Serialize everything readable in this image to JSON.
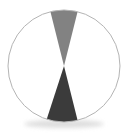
{
  "figure": {
    "background_color": "#ffffff",
    "width": 136,
    "height": 135
  },
  "chart_data": {
    "type": "pie",
    "title": "",
    "subtitle": "",
    "xlabel": "",
    "ylabel": "",
    "legend_position": "none",
    "grid": false,
    "labels_visible": false,
    "center": {
      "x": 64,
      "y": 66
    },
    "radius": 56,
    "start_angle_deg": -90,
    "direction": "clockwise",
    "categories": [
      "Slice A",
      "Slice B",
      "Slice C"
    ],
    "values": [
      8,
      9,
      83
    ],
    "percentages": [
      "8%",
      "9%",
      "83%"
    ],
    "colors": [
      "#828282",
      "#3b3b3b",
      "#ffffff"
    ],
    "slices": [
      {
        "name": "Slice A",
        "value": 8,
        "percent": "8%",
        "color": "#828282",
        "start_angle_deg": -104,
        "end_angle_deg": -76,
        "sweep_deg": 28,
        "position": "top",
        "label": ""
      },
      {
        "name": "Slice B",
        "value": 9,
        "percent": "9%",
        "color": "#3b3b3b",
        "start_angle_deg": 76,
        "end_angle_deg": 108,
        "sweep_deg": 32,
        "position": "bottom",
        "label": ""
      },
      {
        "name": "Slice C",
        "value": 83,
        "percent": "83%",
        "color": "#ffffff",
        "start_angle_deg": 108,
        "end_angle_deg": 256,
        "sweep_deg": 300,
        "position": "left-and-right",
        "label": ""
      }
    ],
    "outline": {
      "color": "#b4b4b4",
      "width": 1
    },
    "shadow": {
      "visible": true,
      "color": "#d8d8d8"
    },
    "annotations": [],
    "tick_labels": [],
    "axis_ranges": null
  }
}
